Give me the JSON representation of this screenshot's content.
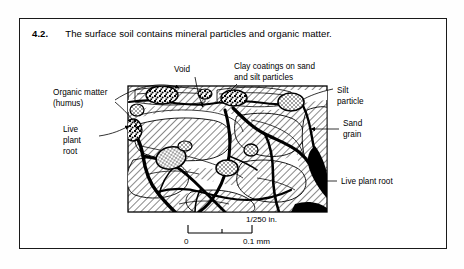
{
  "figure": {
    "number": "4.2.",
    "caption": "The surface soil contains mineral particles and organic matter.",
    "illustration_type": "soil-thin-section-micrograph-diagram",
    "labels": {
      "organic_matter_line1": "Organic matter",
      "organic_matter_line2": "(humus)",
      "void": "Void",
      "clay_coatings_line1": "Clay coatings on sand",
      "clay_coatings_line2": "and silt particles",
      "silt_particle_line1": "Silt",
      "silt_particle_line2": "particle",
      "sand_grain_line1": "Sand",
      "sand_grain_line2": "grain",
      "live_plant_root_left_line1": "Live",
      "live_plant_root_left_line2": "plant",
      "live_plant_root_left_line3": "root",
      "live_plant_root_right": "Live plant root"
    },
    "scale": {
      "imperial": "1/250 in.",
      "tick_start": "0",
      "tick_end": "0.1 mm"
    },
    "colors": {
      "ink": "#000000",
      "frame": "#1a1a1a",
      "paper": "#ffffff",
      "hatch": "#1d1d1d"
    }
  }
}
